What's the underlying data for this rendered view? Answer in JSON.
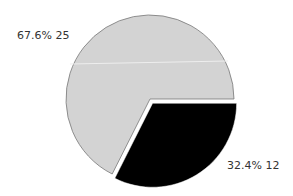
{
  "chart_data": {
    "type": "pie",
    "title": "",
    "slices": [
      {
        "label": "67.6%  25",
        "value": 25,
        "percent": 67.6,
        "color": "#d3d3d3",
        "exploded": false
      },
      {
        "label": "32.4%  12",
        "value": 12,
        "percent": 32.4,
        "color": "#000000",
        "exploded": true
      }
    ],
    "categories": [
      "A",
      "B"
    ],
    "values": [
      25,
      12
    ],
    "legend": false
  },
  "labels": {
    "slice0": "67.6%  25",
    "slice1": "32.4%  12"
  }
}
